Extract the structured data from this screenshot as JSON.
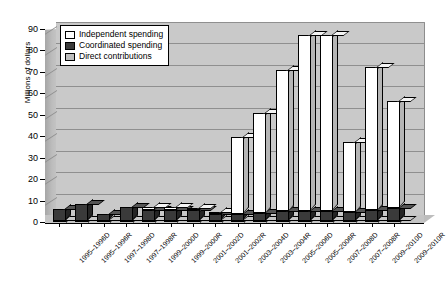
{
  "chart_data": {
    "type": "bar",
    "title": "",
    "subtitle": "",
    "xlabel": "",
    "ylabel": "Millions of dollars",
    "ylim": [
      0,
      90
    ],
    "yticks": [
      0,
      10,
      20,
      30,
      40,
      50,
      60,
      70,
      80,
      90
    ],
    "grid": true,
    "stacked": true,
    "three_d": true,
    "legend_position": "top-left",
    "legend": [
      "Independent spending",
      "Coordinated spending",
      "Direct contributions"
    ],
    "categories": [
      "1995–1996D",
      "1995–1996R",
      "1997–1998D",
      "1997–1998R",
      "1999–2000D",
      "1999–2000R",
      "2001–2002D",
      "2001–2002R",
      "2003–2004D",
      "2003–2004R",
      "2005–2006D",
      "2005–2006R",
      "2007–2008D",
      "2007–2008R",
      "2009–2010D",
      "2009–2010R"
    ],
    "series": [
      {
        "name": "Independent spending",
        "color": "#ffffff",
        "values": [
          0.0,
          0.0,
          0.0,
          0.0,
          1.5,
          1.5,
          1.0,
          0.5,
          36.0,
          47.0,
          66.0,
          82.0,
          82.0,
          33.0,
          67.0,
          50.0
        ]
      },
      {
        "name": "Coordinated spending",
        "color": "#3a3a3a",
        "values": [
          5.5,
          8.0,
          3.0,
          6.5,
          5.0,
          5.0,
          5.0,
          3.0,
          3.0,
          3.5,
          4.5,
          4.5,
          4.5,
          4.0,
          5.0,
          6.0
        ]
      },
      {
        "name": "Direct contributions",
        "color": "#a8a8a8",
        "values": [
          0.5,
          0.5,
          0.5,
          0.5,
          0.5,
          0.5,
          0.5,
          0.5,
          0.5,
          0.5,
          0.5,
          0.5,
          0.5,
          0.5,
          0.5,
          0.5
        ]
      }
    ],
    "totals": [
      6.0,
      8.5,
      3.5,
      7.0,
      7.0,
      7.0,
      6.5,
      4.0,
      39.5,
      51.0,
      71.0,
      87.0,
      87.0,
      37.5,
      72.5,
      56.5
    ]
  }
}
